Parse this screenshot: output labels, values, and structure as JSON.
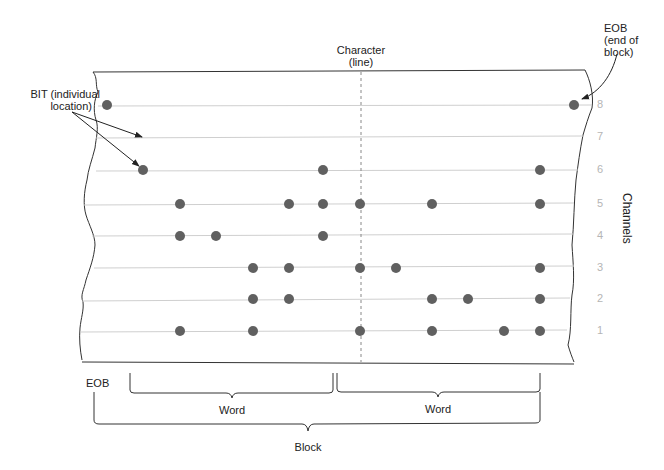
{
  "labels": {
    "character": "Character",
    "character_sub": "(line)",
    "eob_top": "EOB",
    "eob_top_sub1": "(end of",
    "eob_top_sub2": "block)",
    "bit": "BIT (individual",
    "bit_sub": "location)",
    "channels": "Channels",
    "eob_bottom": "EOB",
    "word_left": "Word",
    "word_right": "Word",
    "block": "Block"
  },
  "channels": [
    {
      "number": "8",
      "y": 105,
      "bits_x": [
        107,
        574
      ]
    },
    {
      "number": "7",
      "y": 137,
      "bits_x": []
    },
    {
      "number": "6",
      "y": 170,
      "bits_x": [
        143,
        323,
        540
      ]
    },
    {
      "number": "5",
      "y": 204,
      "bits_x": [
        180,
        289,
        323,
        360,
        432,
        540
      ]
    },
    {
      "number": "4",
      "y": 236,
      "bits_x": [
        180,
        216,
        323
      ]
    },
    {
      "number": "3",
      "y": 268,
      "bits_x": [
        253,
        289,
        360,
        396,
        540
      ]
    },
    {
      "number": "2",
      "y": 299,
      "bits_x": [
        253,
        289,
        432,
        468,
        540
      ]
    },
    {
      "number": "1",
      "y": 331,
      "bits_x": [
        180,
        253,
        360,
        432,
        504,
        540
      ]
    }
  ],
  "colors": {
    "bit": "#606060",
    "track_line": "#cfcfcf",
    "outline": "#333333",
    "channel_number": "#b5b5b5"
  }
}
